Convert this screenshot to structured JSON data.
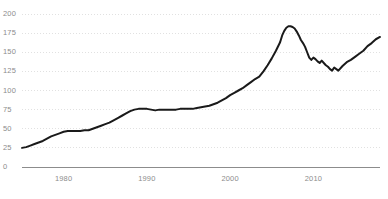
{
  "chart_data": {
    "type": "line",
    "title": "",
    "subtitle": "",
    "xlabel": "",
    "ylabel": "",
    "xlim": [
      1975,
      2018
    ],
    "ylim": [
      0,
      200
    ],
    "grid": true,
    "grid_axis": "y",
    "legend": "none",
    "line_color": "#1a1a1a",
    "grid_color": "#d9d9d9",
    "axis_color": "#8c8c8c",
    "tick_label_color": "#8c8c8c",
    "background_color": "#ffffff",
    "yticks": [
      0,
      25,
      50,
      75,
      100,
      125,
      150,
      175,
      200
    ],
    "ytick_labels": [
      "0",
      "25",
      "50",
      "75",
      "100",
      "125",
      "150",
      "175",
      "200"
    ],
    "xticks": [
      1980,
      1990,
      2000,
      2010
    ],
    "xtick_labels": [
      "1980",
      "1990",
      "2000",
      "2010"
    ],
    "series": [
      {
        "name": "index",
        "x": [
          1975.0,
          1975.5,
          1976.0,
          1976.5,
          1977.0,
          1977.5,
          1978.0,
          1978.5,
          1979.0,
          1979.5,
          1980.0,
          1980.5,
          1981.0,
          1981.5,
          1982.0,
          1982.5,
          1983.0,
          1983.5,
          1984.0,
          1984.5,
          1985.0,
          1985.5,
          1986.0,
          1986.5,
          1987.0,
          1987.5,
          1988.0,
          1988.5,
          1989.0,
          1989.5,
          1990.0,
          1990.5,
          1991.0,
          1991.5,
          1992.0,
          1992.5,
          1993.0,
          1993.5,
          1994.0,
          1994.5,
          1995.0,
          1995.5,
          1996.0,
          1996.5,
          1997.0,
          1997.5,
          1998.0,
          1998.5,
          1999.0,
          1999.5,
          2000.0,
          2000.5,
          2001.0,
          2001.5,
          2002.0,
          2002.5,
          2003.0,
          2003.5,
          2004.0,
          2004.5,
          2005.0,
          2005.5,
          2006.0,
          2006.25,
          2006.5,
          2006.75,
          2007.0,
          2007.25,
          2007.5,
          2007.75,
          2008.0,
          2008.25,
          2008.5,
          2008.75,
          2009.0,
          2009.25,
          2009.5,
          2009.75,
          2010.0,
          2010.25,
          2010.5,
          2010.75,
          2011.0,
          2011.25,
          2011.5,
          2011.75,
          2012.0,
          2012.25,
          2012.5,
          2012.75,
          2013.0,
          2013.5,
          2014.0,
          2014.5,
          2015.0,
          2015.5,
          2016.0,
          2016.5,
          2017.0,
          2017.5,
          2018.0
        ],
        "values": [
          25,
          26,
          28,
          30,
          32,
          34,
          37,
          40,
          42,
          44,
          46,
          47,
          47,
          47,
          47,
          48,
          48,
          50,
          52,
          54,
          56,
          58,
          61,
          64,
          67,
          70,
          73,
          75,
          76,
          76,
          76,
          75,
          74,
          75,
          75,
          75,
          75,
          75,
          76,
          76,
          76,
          76,
          77,
          78,
          79,
          80,
          82,
          84,
          87,
          90,
          94,
          97,
          100,
          103,
          107,
          111,
          115,
          118,
          125,
          133,
          142,
          152,
          163,
          172,
          178,
          182,
          184,
          184,
          183,
          181,
          177,
          172,
          166,
          162,
          157,
          150,
          143,
          140,
          143,
          141,
          138,
          136,
          139,
          136,
          133,
          131,
          128,
          126,
          130,
          128,
          126,
          132,
          137,
          140,
          144,
          148,
          152,
          158,
          162,
          167,
          170
        ]
      }
    ]
  }
}
